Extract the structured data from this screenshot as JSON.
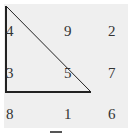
{
  "figure": {
    "grid": [
      [
        "4",
        "9",
        "2"
      ],
      [
        "3",
        "5",
        "7"
      ],
      [
        "8",
        "1",
        "6"
      ]
    ],
    "triangle": {
      "vertices": [
        [
          6,
          6
        ],
        [
          6,
          92
        ],
        [
          91,
          92
        ]
      ],
      "stroke": "#222222"
    },
    "background_color": "#efefef",
    "caption": "图"
  }
}
